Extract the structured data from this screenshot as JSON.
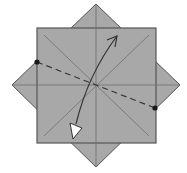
{
  "diagram": {
    "type": "origami-fold-step",
    "colors": {
      "paper": "#a8a8a8",
      "edge": "#555555",
      "crease": "#6e6e6e",
      "dash": "#333333",
      "dot": "#1a1a1a",
      "arrow": "#333333",
      "arrowhead_fill": "#ffffff",
      "background": "#ffffff"
    },
    "square": {
      "x": 37,
      "y": 28,
      "width": 119,
      "height": 115
    },
    "diamond_points": {
      "top": [
        96,
        4
      ],
      "right": [
        180,
        85
      ],
      "bottom": [
        96,
        167
      ],
      "left": [
        12,
        85
      ]
    },
    "reference_dots": [
      {
        "name": "left-dot",
        "cx": 37,
        "cy": 62
      },
      {
        "name": "right-dot",
        "cx": 155,
        "cy": 108
      }
    ],
    "fold_line": {
      "x1": 37,
      "y1": 62,
      "x2": 155,
      "y2": 108,
      "style": "dashed"
    },
    "arrow": {
      "path": "M75,126 C82,95 95,65 117,36",
      "head_open_at": [
        117,
        36
      ],
      "head_closed_at": [
        74,
        135
      ]
    }
  }
}
